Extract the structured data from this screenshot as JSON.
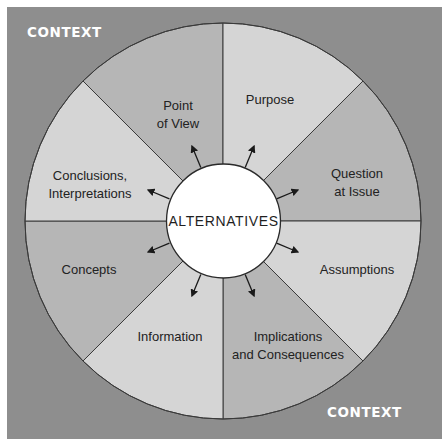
{
  "diagram": {
    "type": "radial-wheel",
    "colors": {
      "context_background": "#8e8e8e",
      "segment_dark": "#b6b6b6",
      "segment_light": "#d5d5d5",
      "center_fill": "#ffffff",
      "stroke": "#3a3a3a",
      "context_text": "#ffffff",
      "label_text": "#222222"
    },
    "context_labels": {
      "top_left": "CONTEXT",
      "bottom_right": "CONTEXT"
    },
    "center": {
      "label": "ALTERNATIVES"
    },
    "segments": [
      {
        "id": "point-of-view",
        "lines": [
          "Point",
          "of View"
        ],
        "shade": "dark"
      },
      {
        "id": "purpose",
        "lines": [
          "Purpose"
        ],
        "shade": "light"
      },
      {
        "id": "question-at-issue",
        "lines": [
          "Question",
          "at Issue"
        ],
        "shade": "dark"
      },
      {
        "id": "assumptions",
        "lines": [
          "Assumptions"
        ],
        "shade": "light"
      },
      {
        "id": "implications",
        "lines": [
          "Implications",
          "and Consequences"
        ],
        "shade": "dark"
      },
      {
        "id": "information",
        "lines": [
          "Information"
        ],
        "shade": "light"
      },
      {
        "id": "concepts",
        "lines": [
          "Concepts"
        ],
        "shade": "dark"
      },
      {
        "id": "conclusions",
        "lines": [
          "Conclusions,",
          "Interpretations"
        ],
        "shade": "light"
      }
    ],
    "arrows": "one arrow from center circle outward into each of the 8 segments"
  }
}
